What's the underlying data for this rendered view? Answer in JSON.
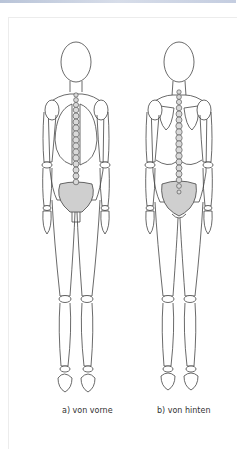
{
  "figures": [
    {
      "id": "front",
      "caption": "a) von vorne"
    },
    {
      "id": "back",
      "caption": "b) von hinten"
    }
  ],
  "colors": {
    "outline": "#444444",
    "pelvis_fill": "#cfcfcf",
    "vertebra_fill": "#d9d9d9",
    "background": "#ffffff"
  }
}
